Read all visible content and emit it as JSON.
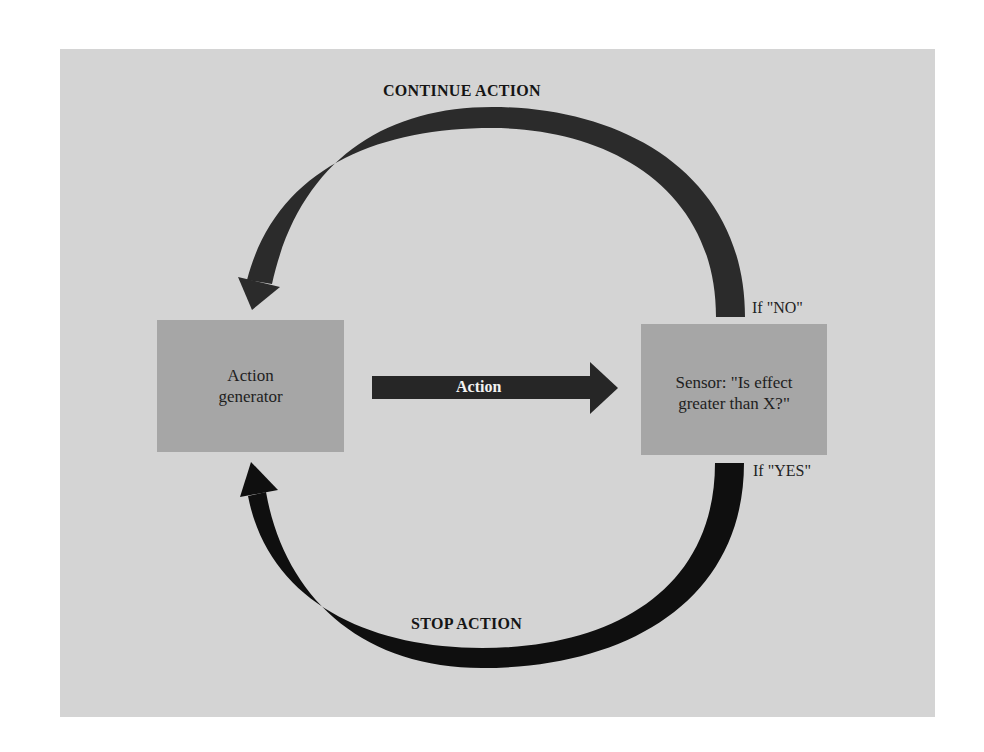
{
  "diagram": {
    "type": "feedback-loop",
    "nodes": {
      "generator": {
        "line1": "Action",
        "line2": "generator"
      },
      "sensor": {
        "line1": "Sensor: \"Is effect",
        "line2": "greater than X?\""
      }
    },
    "edges": {
      "action": {
        "label": "Action",
        "from": "generator",
        "to": "sensor"
      },
      "continue": {
        "label": "CONTINUE ACTION",
        "condition": "If \"NO\"",
        "from": "sensor",
        "to": "generator"
      },
      "stop": {
        "label": "STOP ACTION",
        "condition": "If \"YES\"",
        "from": "sensor",
        "to": "generator"
      }
    },
    "colors": {
      "background": "#d4d4d4",
      "box": "#a6a6a6",
      "continue_arrow": "#2b2b2b",
      "stop_arrow": "#0f0f0f",
      "action_arrow": "#262626"
    }
  }
}
